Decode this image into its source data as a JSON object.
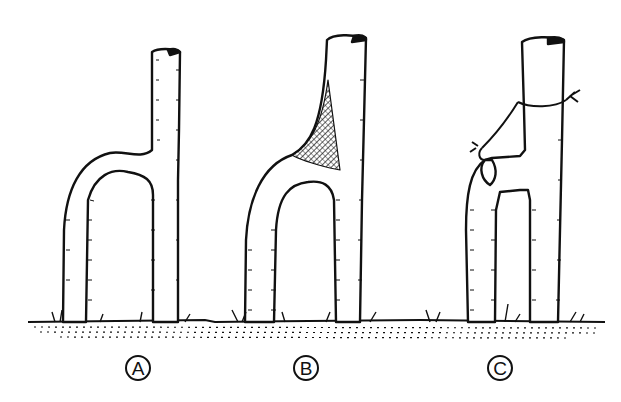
{
  "figure": {
    "colors": {
      "ink": "#111111",
      "background": "#ffffff"
    },
    "panels": [
      {
        "id": "A",
        "label": "A",
        "caption": "Forked stem with a narrow U-shaped crotch"
      },
      {
        "id": "B",
        "label": "B",
        "caption": "Forked stem with a wound/split at the crotch (cross-hatched)"
      },
      {
        "id": "C",
        "label": "C",
        "caption": "Forked stem braced with a tied rope/cable"
      }
    ]
  }
}
